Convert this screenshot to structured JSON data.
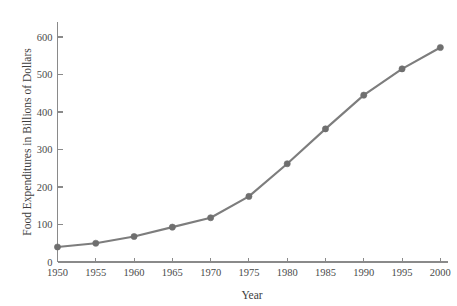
{
  "chart_data": {
    "type": "line",
    "title": "",
    "xlabel": "Year",
    "ylabel": "Food Expenditures in Billions of Dollars",
    "categories": [
      1950,
      1955,
      1960,
      1965,
      1970,
      1975,
      1980,
      1985,
      1990,
      1995,
      2000
    ],
    "x": [
      1950,
      1955,
      1960,
      1965,
      1970,
      1975,
      1980,
      1985,
      1990,
      1995,
      2000
    ],
    "values": [
      40,
      50,
      68,
      93,
      118,
      175,
      262,
      355,
      445,
      515,
      572
    ],
    "series": [
      {
        "name": "Food Expenditures",
        "values": [
          40,
          50,
          68,
          93,
          118,
          175,
          262,
          355,
          445,
          515,
          572
        ]
      }
    ],
    "xlim": [
      1950,
      2001
    ],
    "ylim": [
      0,
      640
    ],
    "xticks": [
      1950,
      1955,
      1960,
      1965,
      1970,
      1975,
      1980,
      1985,
      1990,
      1995,
      2000
    ],
    "xtick_labels": [
      "1950",
      "1955",
      "1960",
      "1965",
      "1970",
      "1975",
      "1980",
      "1985",
      "1990",
      "1995",
      "2000"
    ],
    "yticks": [
      0,
      100,
      200,
      300,
      400,
      500,
      600
    ],
    "ytick_labels": [
      "0",
      "100",
      "200",
      "300",
      "400",
      "500",
      "600"
    ],
    "grid": false,
    "legend": false,
    "legend_position": "none",
    "line_color": "#7d7d7d",
    "marker_color": "#6f6f6f",
    "axis_color": "#8a8a8a",
    "background_color": "#ffffff",
    "marker": "circle"
  }
}
